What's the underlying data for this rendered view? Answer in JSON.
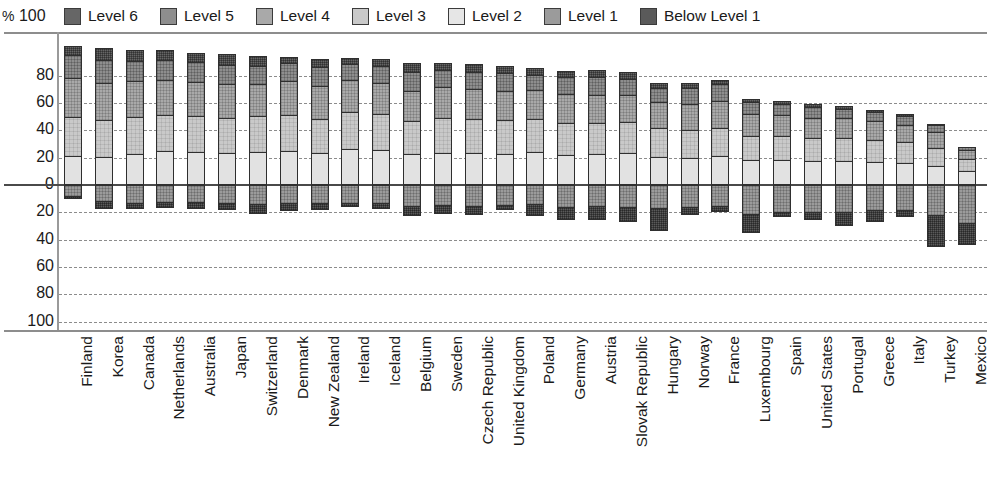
{
  "axis": {
    "unit_label": "%",
    "y_ticks_top": [
      "100",
      "80",
      "60",
      "40",
      "20",
      "0"
    ],
    "y_ticks_bottom": [
      "20",
      "40",
      "60",
      "80",
      "100"
    ]
  },
  "legend": {
    "items": [
      {
        "label": "Level 6",
        "key": "level6",
        "color": "#666666"
      },
      {
        "label": "Level 5",
        "key": "level5",
        "color": "#8e8e8e"
      },
      {
        "label": "Level 4",
        "key": "level4",
        "color": "#a9a9a9"
      },
      {
        "label": "Level 3",
        "key": "level3",
        "color": "#c9c9c9"
      },
      {
        "label": "Level 2",
        "key": "level2",
        "color": "#e6e6e6"
      },
      {
        "label": "Level 1",
        "key": "level1",
        "color": "#9b9b9b"
      },
      {
        "label": "Below Level 1",
        "key": "below1",
        "color": "#5a5a5a"
      }
    ]
  },
  "chart_data": {
    "type": "bar",
    "title": "",
    "xlabel": "",
    "ylabel": "%",
    "ylim": [
      -100,
      100
    ],
    "grid": true,
    "legend_position": "top",
    "orientation": "vertical-stacked-diverging",
    "note": "Positive axis stacks Levels 2-6; negative axis stacks Level 1 and Below Level 1.",
    "categories": [
      "Finland",
      "Korea",
      "Canada",
      "Netherlands",
      "Australia",
      "Japan",
      "Switzerland",
      "Denmark",
      "New Zealand",
      "Ireland",
      "Iceland",
      "Belgium",
      "Sweden",
      "Czech Republic",
      "United Kingdom",
      "Poland",
      "Germany",
      "Austria",
      "Slovak Republic",
      "Hungary",
      "Norway",
      "France",
      "Luxembourg",
      "Spain",
      "United States",
      "Portugal",
      "Greece",
      "Italy",
      "Turkey",
      "Mexico"
    ],
    "series": [
      {
        "name": "Level 6",
        "key": "level6",
        "sign": "positive",
        "values": [
          6.7,
          9.2,
          7.8,
          7.2,
          7.1,
          8.2,
          7.0,
          4.4,
          5.7,
          4.3,
          5.2,
          6.5,
          5.1,
          5.3,
          5.4,
          5.2,
          4.6,
          5.3,
          5.2,
          3.2,
          4.1,
          3.5,
          2.6,
          2.0,
          2.3,
          1.8,
          1.5,
          1.4,
          0.9,
          0.4
        ]
      },
      {
        "name": "Level 5",
        "key": "level5",
        "sign": "positive",
        "values": [
          16.7,
          16.7,
          14.8,
          15.1,
          14.3,
          14.0,
          13.2,
          13.3,
          14.3,
          11.3,
          12.6,
          14.1,
          12.5,
          12.7,
          13.0,
          11.1,
          12.6,
          12.5,
          12.0,
          10.4,
          11.6,
          12.4,
          8.9,
          7.8,
          7.7,
          6.9,
          6.9,
          6.3,
          5.2,
          1.9
        ]
      },
      {
        "name": "Level 4",
        "key": "level4",
        "sign": "positive",
        "values": [
          28.7,
          27.1,
          26.3,
          25.6,
          24.9,
          24.4,
          23.7,
          24.5,
          23.9,
          23.6,
          22.7,
          22.2,
          22.6,
          21.8,
          21.5,
          21.2,
          21.0,
          20.7,
          19.8,
          18.8,
          18.7,
          19.7,
          15.8,
          15.5,
          14.6,
          14.5,
          14.0,
          13.1,
          11.2,
          6.7
        ]
      },
      {
        "name": "Level 3",
        "key": "level3",
        "sign": "positive",
        "values": [
          28.8,
          27.0,
          27.5,
          26.2,
          26.6,
          25.7,
          26.1,
          26.4,
          25.0,
          27.0,
          26.2,
          24.3,
          25.3,
          25.4,
          24.3,
          24.2,
          23.4,
          23.2,
          22.7,
          21.7,
          20.4,
          20.5,
          18.0,
          17.5,
          17.0,
          16.8,
          16.3,
          15.4,
          13.1,
          9.0
        ]
      },
      {
        "name": "Level 2",
        "key": "level2",
        "sign": "positive",
        "values": [
          21.0,
          20.6,
          22.5,
          24.8,
          24.1,
          23.6,
          24.5,
          25.2,
          23.5,
          26.5,
          25.6,
          22.4,
          23.8,
          23.1,
          23.0,
          24.0,
          22.1,
          22.4,
          23.3,
          20.3,
          20.0,
          21.1,
          18.0,
          18.5,
          17.5,
          17.6,
          16.5,
          15.8,
          14.2,
          10.0
        ]
      },
      {
        "name": "Level 1",
        "key": "level1",
        "sign": "negative",
        "values": [
          -8.2,
          -12.0,
          -12.9,
          -12.5,
          -12.3,
          -13.3,
          -14.0,
          -13.2,
          -13.3,
          -13.0,
          -13.5,
          -15.1,
          -14.6,
          -15.6,
          -14.9,
          -14.1,
          -15.9,
          -15.1,
          -16.2,
          -16.5,
          -15.8,
          -15.7,
          -21.0,
          -19.5,
          -19.5,
          -19.5,
          -18.4,
          -18.3,
          -22.3,
          -28.1
        ]
      },
      {
        "name": "Below Level 1",
        "key": "below1",
        "sign": "negative",
        "values": [
          -1.8,
          -5.6,
          -4.5,
          -4.1,
          -5.3,
          -5.2,
          -7.0,
          -5.9,
          -4.8,
          -3.1,
          -4.2,
          -7.7,
          -6.3,
          -6.1,
          -3.6,
          -8.7,
          -10.0,
          -10.2,
          -11.0,
          -17.5,
          -6.3,
          -4.2,
          -14.2,
          -4.1,
          -6.4,
          -10.3,
          -8.9,
          -5.2,
          -23.2,
          -16.1
        ]
      }
    ]
  }
}
